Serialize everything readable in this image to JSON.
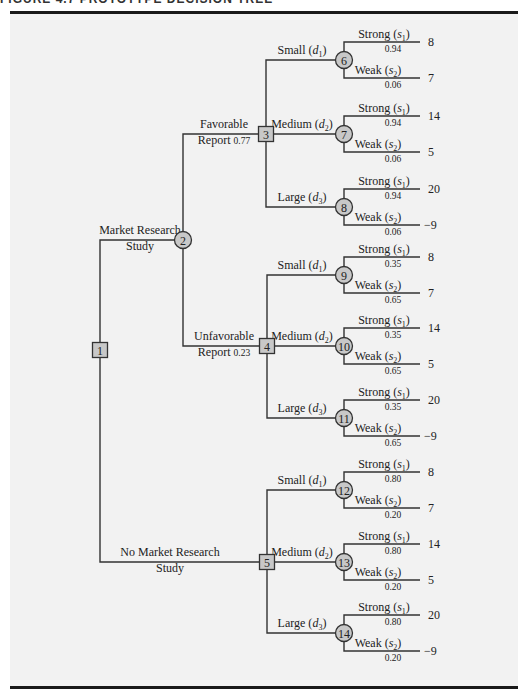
{
  "figure": {
    "header_clipped": "FIGURE 4.7   PROTOTYPE DECISION TREE"
  },
  "colors": {
    "panel_background": "#f2f2f2",
    "node_fill": "#c8c8c8",
    "line": "#333333",
    "rule": "#1a1a1a"
  },
  "nodes": {
    "decision": [
      {
        "id": "1",
        "x": 100,
        "y": 350
      },
      {
        "id": "3",
        "x": 266,
        "y": 134
      },
      {
        "id": "4",
        "x": 267,
        "y": 346
      },
      {
        "id": "5",
        "x": 267,
        "y": 562
      }
    ],
    "chance": [
      {
        "id": "2",
        "x": 183,
        "y": 240
      }
    ]
  },
  "top_branches": [
    {
      "label_line1": "Market Research",
      "label_line2": "Study",
      "from": "1",
      "to": "2"
    },
    {
      "label_line1": "No Market Research",
      "label_line2": "Study",
      "from": "1",
      "to": "5"
    }
  ],
  "report_branches": [
    {
      "label_line1": "Favorable",
      "label_line2": "Report",
      "prob": "0.77",
      "to": "3"
    },
    {
      "label_line1": "Unfavorable",
      "label_line2": "Report",
      "prob": "0.23",
      "to": "4"
    }
  ],
  "decision_groups": [
    {
      "decision_node": "3",
      "options": [
        {
          "name": "Small",
          "sym": "d",
          "sub": "1",
          "chance_node": "6",
          "y": 60,
          "strong": {
            "label": "Strong",
            "sym": "s",
            "sub": "1",
            "prob": "0.94",
            "payoff": "8"
          },
          "weak": {
            "label": "Weak",
            "sym": "s",
            "sub": "2",
            "prob": "0.06",
            "payoff": "7"
          }
        },
        {
          "name": "Medium",
          "sym": "d",
          "sub": "2",
          "chance_node": "7",
          "y": 134,
          "strong": {
            "label": "Strong",
            "sym": "s",
            "sub": "1",
            "prob": "0.94",
            "payoff": "14"
          },
          "weak": {
            "label": "Weak",
            "sym": "s",
            "sub": "2",
            "prob": "0.06",
            "payoff": "5"
          }
        },
        {
          "name": "Large",
          "sym": "d",
          "sub": "3",
          "chance_node": "8",
          "y": 207,
          "strong": {
            "label": "Strong",
            "sym": "s",
            "sub": "1",
            "prob": "0.94",
            "payoff": "20"
          },
          "weak": {
            "label": "Weak",
            "sym": "s",
            "sub": "2",
            "prob": "0.06",
            "payoff": "−9"
          }
        }
      ]
    },
    {
      "decision_node": "4",
      "options": [
        {
          "name": "Small",
          "sym": "d",
          "sub": "1",
          "chance_node": "9",
          "y": 275,
          "strong": {
            "label": "Strong",
            "sym": "s",
            "sub": "1",
            "prob": "0.35",
            "payoff": "8"
          },
          "weak": {
            "label": "Weak",
            "sym": "s",
            "sub": "2",
            "prob": "0.65",
            "payoff": "7"
          }
        },
        {
          "name": "Medium",
          "sym": "d",
          "sub": "2",
          "chance_node": "10",
          "y": 346,
          "strong": {
            "label": "Strong",
            "sym": "s",
            "sub": "1",
            "prob": "0.35",
            "payoff": "14"
          },
          "weak": {
            "label": "Weak",
            "sym": "s",
            "sub": "2",
            "prob": "0.65",
            "payoff": "5"
          }
        },
        {
          "name": "Large",
          "sym": "d",
          "sub": "3",
          "chance_node": "11",
          "y": 418,
          "strong": {
            "label": "Strong",
            "sym": "s",
            "sub": "1",
            "prob": "0.35",
            "payoff": "20"
          },
          "weak": {
            "label": "Weak",
            "sym": "s",
            "sub": "2",
            "prob": "0.65",
            "payoff": "−9"
          }
        }
      ]
    },
    {
      "decision_node": "5",
      "options": [
        {
          "name": "Small",
          "sym": "d",
          "sub": "1",
          "chance_node": "12",
          "y": 490,
          "strong": {
            "label": "Strong",
            "sym": "s",
            "sub": "1",
            "prob": "0.80",
            "payoff": "8"
          },
          "weak": {
            "label": "Weak",
            "sym": "s",
            "sub": "2",
            "prob": "0.20",
            "payoff": "7"
          }
        },
        {
          "name": "Medium",
          "sym": "d",
          "sub": "2",
          "chance_node": "13",
          "y": 562,
          "strong": {
            "label": "Strong",
            "sym": "s",
            "sub": "1",
            "prob": "0.80",
            "payoff": "14"
          },
          "weak": {
            "label": "Weak",
            "sym": "s",
            "sub": "2",
            "prob": "0.20",
            "payoff": "5"
          }
        },
        {
          "name": "Large",
          "sym": "d",
          "sub": "3",
          "chance_node": "14",
          "y": 633,
          "strong": {
            "label": "Strong",
            "sym": "s",
            "sub": "1",
            "prob": "0.80",
            "payoff": "20"
          },
          "weak": {
            "label": "Weak",
            "sym": "s",
            "sub": "2",
            "prob": "0.20",
            "payoff": "−9"
          }
        }
      ]
    }
  ]
}
